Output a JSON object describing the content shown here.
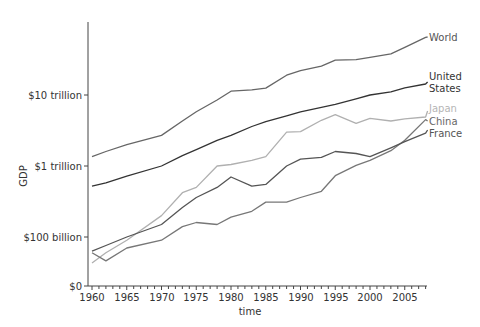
{
  "chart_data": {
    "type": "line",
    "title": "",
    "xlabel": "time",
    "ylabel": "GDP",
    "yscale": "log",
    "x_ticks": [
      1960,
      1965,
      1970,
      1975,
      1980,
      1985,
      1990,
      1995,
      2000,
      2005
    ],
    "x_range": [
      1960,
      2008
    ],
    "y_tick_labels": [
      "$0",
      "$100 billion",
      "$1 trillion",
      "$10 trillion"
    ],
    "y_tick_values_trillion": [
      0,
      0.1,
      1,
      10
    ],
    "grid": false,
    "legend": "inline labels at right end of lines",
    "x": [
      1960,
      1962,
      1965,
      1970,
      1973,
      1975,
      1978,
      1980,
      1983,
      1985,
      1988,
      1990,
      1993,
      1995,
      1998,
      2000,
      2003,
      2005,
      2008
    ],
    "series": [
      {
        "name": "World",
        "label": "World",
        "color": "#666666",
        "values": [
          1.35,
          1.6,
          2.0,
          2.7,
          4.3,
          5.8,
          8.5,
          11.3,
          11.8,
          12.5,
          19.0,
          22.0,
          25.5,
          31.0,
          31.5,
          34.0,
          38.0,
          47.0,
          65.0
        ]
      },
      {
        "name": "United States",
        "label": "United States",
        "color": "#333333",
        "values": [
          0.52,
          0.58,
          0.72,
          1.0,
          1.4,
          1.7,
          2.3,
          2.7,
          3.6,
          4.2,
          5.1,
          5.8,
          6.7,
          7.4,
          8.8,
          10.0,
          11.1,
          12.6,
          14.3
        ]
      },
      {
        "name": "Japan",
        "label": "Japan",
        "color": "#b0b0b0",
        "values": [
          0.043,
          0.06,
          0.09,
          0.2,
          0.42,
          0.5,
          1.0,
          1.05,
          1.2,
          1.35,
          3.0,
          3.05,
          4.4,
          5.3,
          4.0,
          4.7,
          4.3,
          4.6,
          4.9
        ]
      },
      {
        "name": "China",
        "label": "China",
        "color": "#777777",
        "values": [
          0.06,
          0.046,
          0.07,
          0.09,
          0.14,
          0.16,
          0.15,
          0.19,
          0.23,
          0.31,
          0.31,
          0.36,
          0.44,
          0.73,
          1.02,
          1.2,
          1.64,
          2.3,
          4.5
        ]
      },
      {
        "name": "France",
        "label": "France",
        "color": "#555555",
        "values": [
          0.063,
          0.076,
          0.1,
          0.15,
          0.26,
          0.36,
          0.5,
          0.7,
          0.52,
          0.55,
          1.0,
          1.25,
          1.32,
          1.6,
          1.5,
          1.35,
          1.8,
          2.2,
          2.9
        ]
      }
    ]
  },
  "axes": {
    "xlabel": "time",
    "ylabel": "GDP",
    "x_ticks": [
      "1960",
      "1965",
      "1970",
      "1975",
      "1980",
      "1985",
      "1990",
      "1995",
      "2000",
      "2005"
    ],
    "y_ticks": [
      "$0",
      "$100 billion",
      "$1 trillion",
      "$10 trillion"
    ]
  },
  "labels": {
    "world": "World",
    "us_line1": "United",
    "us_line2": "States",
    "japan": "Japan",
    "china": "China",
    "france": "France"
  }
}
